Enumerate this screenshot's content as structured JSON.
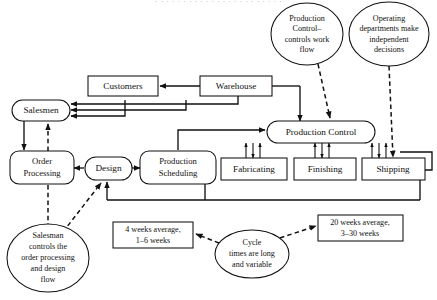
{
  "figure": {
    "clipped_top_line": "· · · · · · · · · · · · · · · · · · · · · · ·",
    "type": "flow-diagram"
  },
  "nodes": {
    "customers": "Customers",
    "warehouse": "Warehouse",
    "salesmen": "Salesmen",
    "order_processing_l1": "Order",
    "order_processing_l2": "Processing",
    "design": "Design",
    "production_scheduling_l1": "Production",
    "production_scheduling_l2": "Scheduling",
    "production_control": "Production Control",
    "fabricating": "Fabricating",
    "finishing": "Finishing",
    "shipping": "Shipping"
  },
  "ellipses": {
    "pc_note": [
      "Production",
      "Control–",
      "controls work",
      "flow"
    ],
    "dept_note": [
      "Operating",
      "departments make",
      "independent",
      "decisions"
    ],
    "salesman_note": [
      "Salesman",
      "controls the",
      "order processing",
      "and design",
      "flow"
    ],
    "cycle_note": [
      "Cycle",
      "times are long",
      "and variable"
    ]
  },
  "annotations": {
    "lead_time_short": [
      "4 weeks average,",
      "1–6 weeks"
    ],
    "lead_time_long": [
      "20 weeks average,",
      "3–30 weeks"
    ]
  },
  "colors": {
    "stroke": "#111111",
    "background": "#ffffff"
  }
}
